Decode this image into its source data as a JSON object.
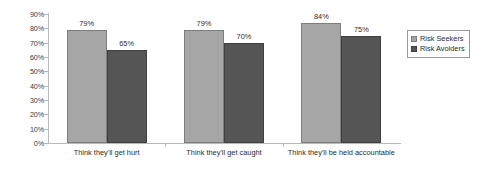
{
  "chart_data": {
    "type": "bar",
    "title": "",
    "subtitle": "",
    "xlabel": "",
    "ylabel": "",
    "ylim": [
      0,
      90
    ],
    "ytick_step": 10,
    "grid": false,
    "legend_position": "right",
    "categories": [
      "Think they'll get hurt",
      "Think they'll get caught",
      "Think they'll be held accountable"
    ],
    "ytick_labels": [
      "0%",
      "10%",
      "20%",
      "30%",
      "40%",
      "50%",
      "60%",
      "70%",
      "80%",
      "90%"
    ],
    "ytick_values": [
      0,
      10,
      20,
      30,
      40,
      50,
      60,
      70,
      80,
      90
    ],
    "series": [
      {
        "name": "Risk Seekers",
        "color": "#a6a6a6",
        "values": [
          79,
          79,
          84
        ],
        "labels": [
          "79%",
          "79%",
          "84%"
        ]
      },
      {
        "name": "Risk Avoiders",
        "color": "#555555",
        "values": [
          65,
          70,
          75
        ],
        "labels": [
          "65%",
          "70%",
          "75%"
        ]
      }
    ]
  },
  "legend": {
    "items": [
      {
        "label": "Risk Seekers",
        "color": "#a6a6a6"
      },
      {
        "label": "Risk Avoiders",
        "color": "#555555"
      }
    ]
  }
}
